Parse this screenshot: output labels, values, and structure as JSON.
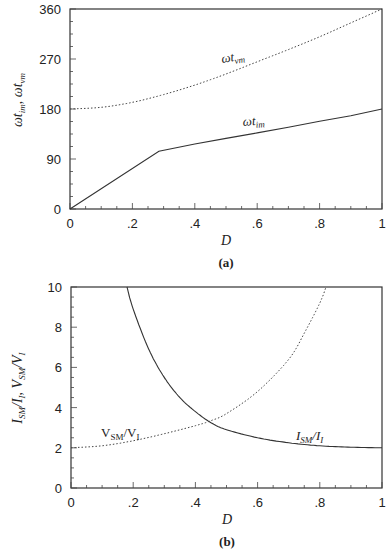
{
  "chart_data": [
    {
      "type": "line",
      "panel": "a",
      "caption": "(a)",
      "xlabel": "D",
      "ylabel": "ωt_im, ωt_vm",
      "xlim": [
        0,
        1
      ],
      "ylim": [
        0,
        360
      ],
      "xticks": [
        "0",
        ".2",
        ".4",
        ".6",
        ".8",
        "1"
      ],
      "yticks": [
        "0",
        "90",
        "180",
        "270",
        "360"
      ],
      "grid": false,
      "series": [
        {
          "name": "ωt_vm",
          "style": "dotted",
          "x": [
            0,
            0.1,
            0.2,
            0.3,
            0.4,
            0.5,
            0.6,
            0.7,
            0.8,
            0.9,
            1.0
          ],
          "y": [
            180,
            183,
            192,
            206,
            223,
            243,
            265,
            287,
            310,
            335,
            360
          ]
        },
        {
          "name": "ωt_im",
          "style": "solid",
          "x": [
            0,
            0.285,
            0.4,
            0.5,
            0.6,
            0.7,
            0.8,
            0.9,
            1.0
          ],
          "y": [
            0,
            104,
            117,
            127,
            137,
            147,
            158,
            168,
            180
          ]
        }
      ],
      "annotations": [
        {
          "text": "ωt_vm",
          "x": 0.52,
          "y": 290
        },
        {
          "text": "ωt_im",
          "x": 0.56,
          "y": 170
        }
      ]
    },
    {
      "type": "line",
      "panel": "b",
      "caption": "(b)",
      "xlabel": "D",
      "ylabel": "I_SM/I_I, V_SM/V_I",
      "xlim": [
        0,
        1
      ],
      "ylim": [
        0,
        10
      ],
      "xticks": [
        "0",
        ".2",
        ".4",
        ".6",
        ".8",
        "1"
      ],
      "yticks": [
        "0",
        "2",
        "4",
        "6",
        "8",
        "10"
      ],
      "grid": false,
      "series": [
        {
          "name": "I_SM/I_I",
          "style": "solid",
          "x": [
            0.18,
            0.2,
            0.25,
            0.3,
            0.35,
            0.4,
            0.45,
            0.5,
            0.6,
            0.7,
            0.8,
            0.9,
            1.0
          ],
          "y": [
            10,
            8.9,
            6.9,
            5.5,
            4.5,
            3.8,
            3.25,
            2.9,
            2.5,
            2.25,
            2.1,
            2.03,
            2.0
          ]
        },
        {
          "name": "V_SM/V_I",
          "style": "dotted",
          "x": [
            0,
            0.1,
            0.2,
            0.3,
            0.4,
            0.45,
            0.5,
            0.6,
            0.7,
            0.75,
            0.8,
            0.82
          ],
          "y": [
            2.0,
            2.1,
            2.35,
            2.7,
            3.1,
            3.35,
            3.7,
            4.8,
            6.4,
            7.7,
            9.2,
            10
          ]
        }
      ],
      "annotations": [
        {
          "text": "V_SM/V_I",
          "x": 0.1,
          "y": 2.8
        },
        {
          "text": "I_SM/I_I",
          "x": 0.72,
          "y": 2.6
        }
      ]
    }
  ],
  "panels": {
    "a": {
      "caption": "(a)",
      "xlabel": "D",
      "ylabel_main": "ωt",
      "ylabel_sub1": "im",
      "ylabel_sep": ", ωt",
      "ylabel_sub2": "vm",
      "label_vm_main": "ωt",
      "label_vm_sub": "vm",
      "label_im_main": "ωt",
      "label_im_sub": "im",
      "xticks": [
        "0",
        ".2",
        ".4",
        ".6",
        ".8",
        "1"
      ],
      "yticks": [
        "0",
        "90",
        "180",
        "270",
        "360"
      ]
    },
    "b": {
      "caption": "(b)",
      "xlabel": "D",
      "ylabel_i": "I",
      "ylabel_i_sub": "SM",
      "ylabel_mid1": "/I",
      "ylabel_i2_sub": "I",
      "ylabel_mid2": ", V",
      "ylabel_v_sub": "SM",
      "ylabel_end": "/V",
      "ylabel_v2_sub": "I",
      "label_v": "V",
      "label_v_sub": "SM",
      "label_v_mid": "/V",
      "label_v_sub2": "I",
      "label_i": "I",
      "label_i_sub": "SM",
      "label_i_mid": "/I",
      "label_i_sub2": "I",
      "xticks": [
        "0",
        ".2",
        ".4",
        ".6",
        ".8",
        "1"
      ],
      "yticks": [
        "0",
        "2",
        "4",
        "6",
        "8",
        "10"
      ]
    }
  }
}
